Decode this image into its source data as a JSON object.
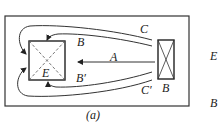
{
  "diagram": {
    "caption": "(a)",
    "labels": {
      "emitter": "E",
      "beam_B": "B",
      "beam_Bprime": "B′",
      "beam_C": "C",
      "beam_Cprime": "C′",
      "beam_A": "A",
      "source": "B"
    },
    "side_labels": [
      "E",
      "B"
    ]
  }
}
